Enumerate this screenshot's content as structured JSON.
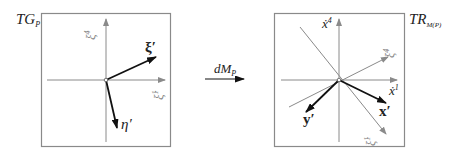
{
  "diagram": {
    "type": "linear-map-of-tangent-spaces",
    "left_panel": {
      "title": "TG",
      "title_subscript": "P",
      "axes": {
        "horizontal": {
          "label": "ξ̇",
          "superscript": "1"
        },
        "vertical": {
          "label": "ξ̇",
          "superscript": "4"
        }
      },
      "vectors": [
        {
          "name": "xi-prime",
          "label": "ξ′",
          "style": "bold"
        },
        {
          "name": "eta-prime",
          "label": "η′",
          "style": "bold"
        }
      ]
    },
    "mapping": {
      "label": "dM",
      "subscript": "P"
    },
    "right_panel": {
      "title": "TR",
      "title_subscript": "M(P)",
      "axes": {
        "horizontal": {
          "label": "ẋ",
          "superscript": "1"
        },
        "vertical": {
          "label": "ẋ",
          "superscript": "4"
        }
      },
      "image_axes": [
        {
          "name": "xi1-image",
          "label": "ξ̇",
          "superscript": "1"
        },
        {
          "name": "xi4-image",
          "label": "ξ̇",
          "superscript": "4"
        }
      ],
      "vectors": [
        {
          "name": "x-prime",
          "label": "x′",
          "style": "bold"
        },
        {
          "name": "y-prime",
          "label": "y′",
          "style": "bold"
        }
      ]
    },
    "colors": {
      "frame": "#8a8a8a",
      "axis": "#8a8a8a",
      "vector": "#111111",
      "text": "#222222",
      "muted_text": "#888888"
    }
  }
}
